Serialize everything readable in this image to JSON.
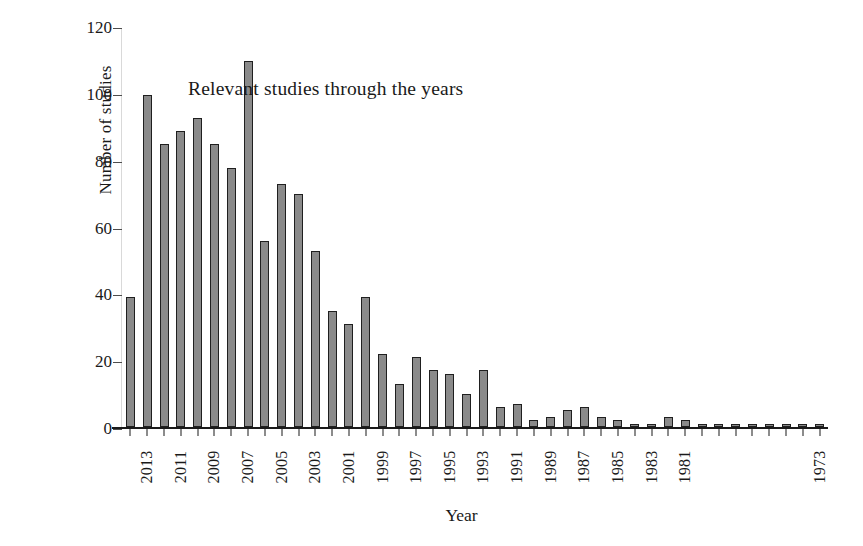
{
  "chart_data": {
    "type": "bar",
    "title": "Relevant studies through the years",
    "xlabel": "Year",
    "ylabel": "Number of studies",
    "ylim": [
      0,
      120
    ],
    "yticks": [
      0,
      20,
      40,
      60,
      80,
      100,
      120
    ],
    "grid": false,
    "legend": null,
    "bar_color": "#8a8a8a",
    "bar_edge_color": "#1f1f1f",
    "categories": [
      "2014",
      "2013",
      "2012",
      "2011",
      "2010",
      "2009",
      "2008",
      "2007",
      "2006",
      "2005",
      "2004",
      "2003",
      "2002",
      "2001",
      "2000",
      "1999",
      "1998",
      "1997",
      "1996",
      "1995",
      "1994",
      "1993",
      "1992",
      "1991",
      "1990",
      "1989",
      "1988",
      "1987",
      "1986",
      "1985",
      "1984",
      "1983",
      "1982",
      "1981",
      "1980",
      "1979",
      "1978",
      "1977",
      "1976",
      "1975",
      "1974",
      "1973"
    ],
    "values": [
      39,
      100,
      85,
      89,
      93,
      85,
      78,
      110,
      56,
      73,
      70,
      53,
      35,
      31,
      39,
      22,
      13,
      21,
      17,
      16,
      10,
      17,
      6,
      7,
      2,
      3,
      5,
      6,
      3,
      2,
      1,
      1,
      3,
      2,
      1,
      1,
      1,
      1,
      1,
      1,
      1,
      1
    ],
    "visible_tick_labels": [
      "2013",
      "2011",
      "2009",
      "2007",
      "2005",
      "2003",
      "2001",
      "1999",
      "1997",
      "1995",
      "1993",
      "1991",
      "1989",
      "1987",
      "1985",
      "1983",
      "1981",
      "1973"
    ],
    "tick_label_rotation": -90,
    "tick_label_interval_years": 2,
    "note": "Tick labels shown every other category from 2013 down to 1981; final labelled tick is 1973"
  }
}
